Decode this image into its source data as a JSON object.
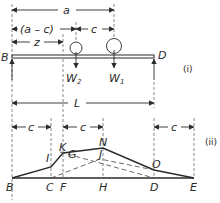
{
  "diagram": {
    "part_i": {
      "tag": "(i)",
      "dimensions": {
        "a": "a",
        "a_minus_c": "(a – c)",
        "c": "c",
        "z": "z",
        "L": "L"
      },
      "supports": {
        "left": "B",
        "right": "D"
      },
      "loads": [
        {
          "name": "W",
          "sub": "2"
        },
        {
          "name": "W",
          "sub": "1"
        }
      ]
    },
    "part_ii": {
      "tag": "(ii)",
      "dimensions": {
        "c_left": "c",
        "c_mid": "c",
        "c_right": "c"
      },
      "points": {
        "B": "B",
        "C": "C",
        "F": "F",
        "H": "H",
        "D": "D",
        "E": "E",
        "I": "I",
        "K": "K",
        "G": "G",
        "N": "N",
        "J": "J",
        "O": "O"
      }
    }
  }
}
